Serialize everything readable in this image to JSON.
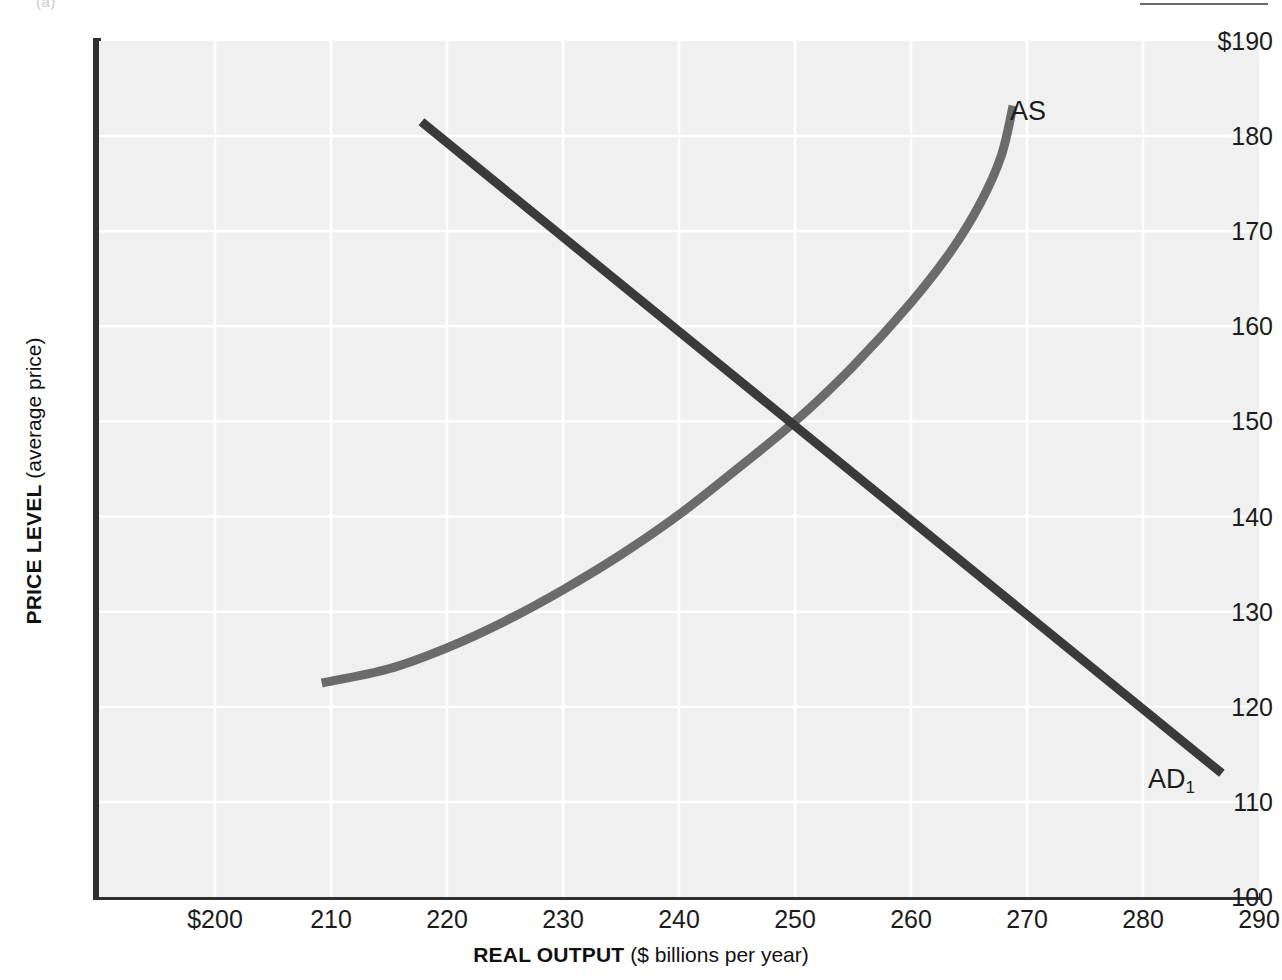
{
  "figure": {
    "crop_caption": "(a)"
  },
  "chart_data": {
    "type": "line",
    "title": "",
    "xlabel_bold": "REAL OUTPUT",
    "xlabel_light": "($ billions per year)",
    "ylabel_bold": "PRICE LEVEL",
    "ylabel_light": "(average price)",
    "xlim": [
      190,
      290
    ],
    "ylim": [
      100,
      190
    ],
    "xticks": [
      200,
      210,
      220,
      230,
      240,
      250,
      260,
      270,
      280,
      290
    ],
    "xtick_labels": [
      "$200",
      "210",
      "220",
      "230",
      "240",
      "250",
      "260",
      "270",
      "280",
      "290"
    ],
    "yticks": [
      100,
      110,
      120,
      130,
      140,
      150,
      160,
      170,
      180,
      190
    ],
    "ytick_labels": [
      "100",
      "110",
      "120",
      "130",
      "140",
      "150",
      "160",
      "170",
      "180",
      "$190"
    ],
    "grid": true,
    "grid_color": "#ffffff",
    "plot_bg": "#f0f0f0",
    "legend": "none",
    "series": [
      {
        "name": "AS",
        "label": "AS",
        "color": "#6b6b6b",
        "description": "Aggregate supply curve, upward sloping and becoming vertical near full capacity",
        "points": [
          [
            209.2,
            122.5
          ],
          [
            215.0,
            124.0
          ],
          [
            220.0,
            126.2
          ],
          [
            225.0,
            129.0
          ],
          [
            230.0,
            132.3
          ],
          [
            235.0,
            136.0
          ],
          [
            240.0,
            140.2
          ],
          [
            245.0,
            145.0
          ],
          [
            250.0,
            150.0
          ],
          [
            255.0,
            155.8
          ],
          [
            260.0,
            162.5
          ],
          [
            263.5,
            168.0
          ],
          [
            266.0,
            173.0
          ],
          [
            267.8,
            178.0
          ],
          [
            268.8,
            183.2
          ]
        ]
      },
      {
        "name": "AD1",
        "label": "AD",
        "label_sub": "1",
        "color": "#3a3a3a",
        "description": "Aggregate demand curve, downward sloping straight line",
        "points": [
          [
            217.8,
            181.5
          ],
          [
            286.8,
            113.0
          ]
        ]
      }
    ],
    "annotations": [
      {
        "name": "equilibrium",
        "x": 250,
        "y": 150,
        "description": "Intersection of AS and AD1 at real output 250 and price level 150"
      }
    ]
  }
}
